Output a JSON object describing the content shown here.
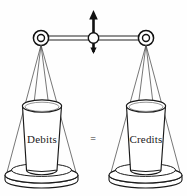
{
  "figure": {
    "background_color": "#fefefe",
    "stroke_color": "#1a1a1a",
    "fill_color": "#ffffff",
    "left_pan": {
      "label": "Debits",
      "label_color": "#1a1a1a"
    },
    "right_pan": {
      "label": "Credits",
      "label_color": "#1a1a1a"
    },
    "relation": {
      "symbol": "=",
      "color": "#2b2b2b"
    },
    "pivot": {
      "arrow_direction": "vertical-double",
      "fulcrum_shape": "circle"
    },
    "hangers": {
      "left_ring": "double-circle",
      "right_ring": "double-circle",
      "string_count": 4
    }
  }
}
